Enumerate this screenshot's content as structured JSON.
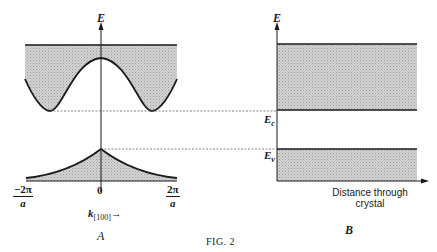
{
  "figure": {
    "caption": "FIG. 2",
    "panel_a": {
      "label": "A",
      "y_axis_label": "E",
      "x_axis_label_main": "k",
      "x_axis_label_sub": "[100]",
      "x_axis_arrow": "→",
      "ticks": [
        {
          "numerator": "−2π",
          "denominator": "a"
        },
        {
          "value": "0"
        },
        {
          "numerator": "2π",
          "denominator": "a"
        }
      ],
      "conduction_band": "shaded region above E(k) curve with minima near ±2π/a",
      "valence_band": "shaded region below E(k) peak at k=0"
    },
    "panel_b": {
      "label": "B",
      "y_axis_label": "E",
      "x_axis_label_line1": "Distance through",
      "x_axis_label_line2": "crystal",
      "level_conduction": "E",
      "level_conduction_sub": "c",
      "level_valence": "E",
      "level_valence_sub": "v"
    },
    "colors": {
      "ink": "#1a1a1a",
      "shade": "#c8c8c8",
      "dash": "#666666"
    }
  }
}
